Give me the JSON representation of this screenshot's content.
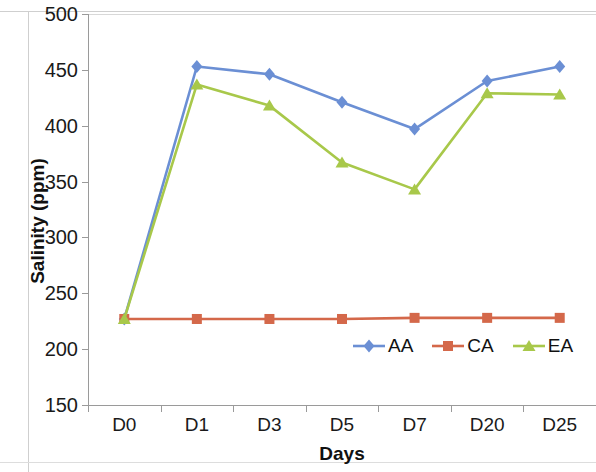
{
  "chart_data": {
    "type": "line",
    "title": "",
    "xlabel": "Days",
    "ylabel": "Salinity (ppm)",
    "categories": [
      "D0",
      "D1",
      "D3",
      "D5",
      "D7",
      "D20",
      "D25"
    ],
    "ylim": [
      150,
      500
    ],
    "yticks": [
      150,
      200,
      250,
      300,
      350,
      400,
      450,
      500
    ],
    "ytick_labels": [
      "150",
      "200",
      "250",
      "300",
      "350",
      "400",
      "450",
      "500"
    ],
    "grid": false,
    "legend_position": "inside-bottom-right",
    "series": [
      {
        "name": "AA",
        "color": "#6B8FD4",
        "marker": "diamond",
        "values": [
          227,
          453,
          446,
          421,
          397,
          440,
          453
        ]
      },
      {
        "name": "CA",
        "color": "#D4684A",
        "marker": "square",
        "values": [
          227,
          227,
          227,
          227,
          228,
          228,
          228
        ]
      },
      {
        "name": "EA",
        "color": "#A8C84A",
        "marker": "triangle",
        "values": [
          227,
          437,
          418,
          367,
          343,
          429,
          428
        ]
      }
    ]
  },
  "axis": {
    "y_title": "Salinity (ppm)",
    "x_title": "Days"
  }
}
